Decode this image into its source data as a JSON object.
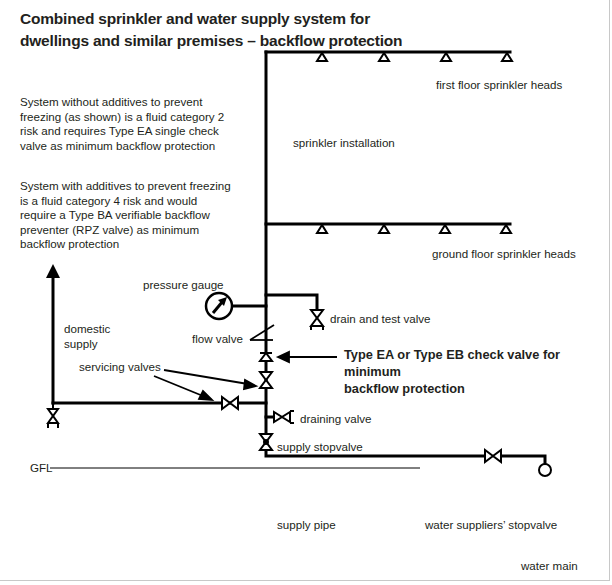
{
  "title": {
    "line1": "Combined sprinkler and water supply system for",
    "line2": "dwellings and similar premises – backflow protection"
  },
  "notes": [
    {
      "lines": [
        "System without additives to prevent",
        "freezing (as shown) is a fluid category 2",
        "risk and requires Type EA single check",
        "valve as minimum backflow protection"
      ]
    },
    {
      "lines": [
        "System with additives to prevent freezing",
        "is a fluid category 4 risk and would",
        "require a Type BA verifiable backflow",
        "preventer (RPZ valve) as minimum",
        "backflow protection"
      ]
    }
  ],
  "labels": {
    "first_floor_heads": "first floor sprinkler heads",
    "sprinkler_installation": "sprinkler installation",
    "ground_floor_heads": "ground floor sprinkler heads",
    "pressure_gauge": "pressure gauge",
    "domestic_supply_1": "domestic",
    "domestic_supply_2": "supply",
    "drain_test_valve": "drain and test valve",
    "flow_valve": "flow valve",
    "servicing_valves": "servicing valves",
    "check_valve_1": "Type EA or Type EB check valve for minimum",
    "check_valve_2": "backflow protection",
    "draining_valve": "draining valve",
    "supply_stopvalve": "supply stopvalve",
    "gfl": "GFL",
    "supply_pipe": "supply pipe",
    "water_suppliers_stopvalve": "water suppliers’ stopvalve",
    "water_main": "water main"
  },
  "components": {
    "first_floor_sprinkler_heads": 4,
    "ground_floor_sprinkler_heads": 4,
    "valves": [
      "drain and test valve",
      "flow valve",
      "check valve",
      "servicing valve (riser)",
      "servicing valve (domestic branch)",
      "draining valve",
      "supply stopvalve",
      "water suppliers' stopvalve",
      "domestic outlet valve"
    ]
  },
  "colors": {
    "line": "#000000",
    "text": "#231f20",
    "border": "#c8c8c8"
  }
}
